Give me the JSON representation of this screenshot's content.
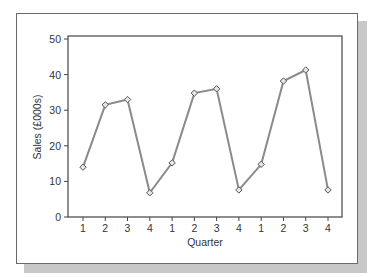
{
  "chart_data": {
    "type": "line",
    "title": "",
    "xlabel": "Quarter",
    "ylabel": "Sales (£000s)",
    "ylim": [
      0,
      50
    ],
    "yticks": [
      0,
      10,
      20,
      30,
      40,
      50
    ],
    "grid": false,
    "legend": null,
    "categories": [
      "1",
      "2",
      "3",
      "4",
      "1",
      "2",
      "3",
      "4",
      "1",
      "2",
      "3",
      "4"
    ],
    "series": [
      {
        "name": "Sales",
        "values": [
          14,
          31.5,
          33,
          6.8,
          15.2,
          34.8,
          36,
          7.6,
          14.8,
          38.2,
          41.3,
          7.6
        ],
        "color": "#8a8a8a",
        "marker": "diamond"
      }
    ]
  }
}
